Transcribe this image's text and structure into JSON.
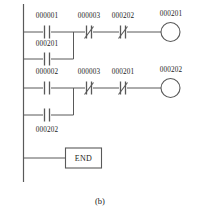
{
  "figure": {
    "caption": "(b)",
    "type": "ladder-logic-diagram"
  },
  "ladder": {
    "end_instruction": "END",
    "rungs": [
      {
        "id": "rung-1",
        "elements": [
          {
            "kind": "contact-no",
            "label": "000001"
          },
          {
            "kind": "contact-nc",
            "label": "000003"
          },
          {
            "kind": "contact-nc",
            "label": "000202"
          },
          {
            "kind": "coil",
            "label": "000201"
          }
        ]
      },
      {
        "id": "branch-1",
        "elements": [
          {
            "kind": "contact-no",
            "label": "000201"
          }
        ]
      },
      {
        "id": "rung-2",
        "elements": [
          {
            "kind": "contact-no",
            "label": "000002"
          },
          {
            "kind": "contact-nc",
            "label": "000003"
          },
          {
            "kind": "contact-nc",
            "label": "000201"
          },
          {
            "kind": "coil",
            "label": "000202"
          }
        ]
      },
      {
        "id": "branch-2",
        "elements": [
          {
            "kind": "contact-no",
            "label": "000202"
          }
        ]
      },
      {
        "id": "rung-3",
        "elements": [
          {
            "kind": "block",
            "label": "END"
          }
        ]
      }
    ],
    "labels": {
      "r1_c1": "000001",
      "r1_c2": "000003",
      "r1_c3": "000202",
      "r1_coil": "000201",
      "b1_c1": "000201",
      "r2_c1": "000002",
      "r2_c2": "000003",
      "r2_c3": "000201",
      "r2_coil": "000202",
      "b2_c1": "000202",
      "end": "END"
    },
    "colors": {
      "line": "#555555",
      "text": "#1a1a1a",
      "background": "#ffffff"
    }
  }
}
